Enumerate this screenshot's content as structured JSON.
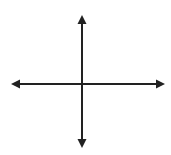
{
  "diagram": {
    "type": "coordinate-axes",
    "width": 171,
    "height": 155,
    "background": "#ffffff",
    "stroke_color": "#222222",
    "stroke_width": 2,
    "origin": {
      "x": 82,
      "y": 84
    },
    "x_axis": {
      "x1": 18,
      "x2": 158,
      "y": 84,
      "arrow_left_tip": 11,
      "arrow_right_tip": 165
    },
    "y_axis": {
      "y1": 22,
      "y2": 141,
      "x": 82,
      "arrow_top_tip": 15,
      "arrow_bottom_tip": 148
    },
    "arrowheads": [
      "up",
      "down",
      "left",
      "right"
    ]
  }
}
